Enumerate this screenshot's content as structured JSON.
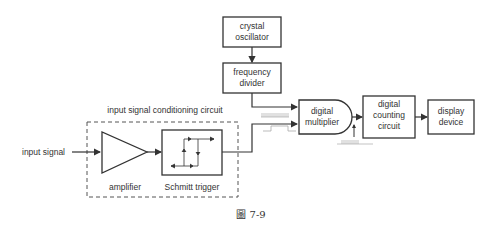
{
  "diagram": {
    "caption": "圖 7-9",
    "group_label": "input signal conditioning circuit",
    "input_label": "input signal",
    "blocks": {
      "crystal_oscillator": [
        "crystal",
        "oscillator"
      ],
      "frequency_divider": [
        "frequency",
        "divider"
      ],
      "digital_multiplier": [
        "digital",
        "multiplier"
      ],
      "digital_counting_circuit": [
        "digital",
        "counting",
        "circuit"
      ],
      "display_device": [
        "display",
        "device"
      ],
      "amplifier": "amplifier",
      "schmitt_trigger": "Schmitt trigger"
    },
    "colors": {
      "stroke": "#333333",
      "text": "#333333",
      "waveform": "#aaaaaa",
      "background": "#ffffff"
    }
  }
}
